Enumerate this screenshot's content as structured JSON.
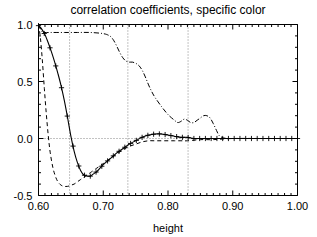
{
  "chart_data": {
    "type": "line",
    "title": "correlation coefficients, specific color",
    "xlabel": "height",
    "ylabel": "",
    "xlim": [
      0.6,
      1.0
    ],
    "ylim": [
      -0.5,
      1.0
    ],
    "grid": true,
    "grid_style": "dotted",
    "legend_position": "none",
    "xticks": [
      0.6,
      0.7,
      0.8,
      0.9,
      1.0
    ],
    "xticklabels": [
      "0.60",
      "0.70",
      "0.80",
      "0.90",
      "1.00"
    ],
    "yticks": [
      -0.5,
      0.0,
      0.5,
      1.0
    ],
    "yticklabels": [
      "-0.5",
      "0.0",
      "0.5",
      "1.0"
    ],
    "x_minor_ticks_per_major": 10,
    "y_minor_ticks_per_major": 5,
    "vertical_gridlines": [
      0.648,
      0.738,
      0.831
    ],
    "horizontal_gridlines": [
      0.0
    ],
    "series": [
      {
        "name": "solid-with-plus-markers",
        "style": "solid",
        "marker": "plus",
        "x": [
          0.6,
          0.605,
          0.61,
          0.615,
          0.62,
          0.625,
          0.63,
          0.635,
          0.64,
          0.645,
          0.65,
          0.655,
          0.66,
          0.665,
          0.67,
          0.675,
          0.68,
          0.685,
          0.69,
          0.695,
          0.7,
          0.71,
          0.72,
          0.73,
          0.74,
          0.75,
          0.76,
          0.77,
          0.78,
          0.79,
          0.8,
          0.81,
          0.82,
          0.83,
          0.84,
          0.85,
          0.86,
          0.87,
          0.88,
          0.89,
          0.9,
          0.92,
          0.94,
          0.96,
          0.98,
          1.0
        ],
        "y": [
          0.99,
          0.96,
          0.91,
          0.84,
          0.76,
          0.67,
          0.57,
          0.46,
          0.33,
          0.18,
          0.02,
          -0.11,
          -0.21,
          -0.28,
          -0.32,
          -0.33,
          -0.33,
          -0.31,
          -0.29,
          -0.26,
          -0.23,
          -0.18,
          -0.13,
          -0.09,
          -0.05,
          -0.02,
          0.01,
          0.03,
          0.04,
          0.04,
          0.03,
          0.02,
          0.01,
          0.01,
          0.0,
          0.0,
          0.0,
          0.0,
          0.0,
          0.0,
          0.0,
          0.0,
          0.0,
          0.0,
          0.0,
          0.0
        ]
      },
      {
        "name": "dashed",
        "style": "dashed",
        "marker": "none",
        "x": [
          0.6,
          0.603,
          0.606,
          0.609,
          0.612,
          0.615,
          0.618,
          0.622,
          0.626,
          0.63,
          0.635,
          0.64,
          0.645,
          0.65,
          0.655,
          0.66,
          0.665,
          0.67,
          0.675,
          0.68,
          0.69,
          0.7,
          0.71,
          0.72,
          0.73,
          0.74,
          0.75,
          0.76,
          0.77,
          0.78,
          0.79,
          0.8,
          0.81,
          0.82,
          0.83,
          0.85,
          0.87,
          0.9,
          0.95,
          1.0
        ],
        "y": [
          1.0,
          0.88,
          0.68,
          0.44,
          0.22,
          0.03,
          -0.12,
          -0.25,
          -0.33,
          -0.38,
          -0.41,
          -0.42,
          -0.42,
          -0.41,
          -0.4,
          -0.38,
          -0.36,
          -0.34,
          -0.32,
          -0.3,
          -0.26,
          -0.22,
          -0.18,
          -0.14,
          -0.1,
          -0.07,
          -0.05,
          -0.03,
          -0.02,
          -0.02,
          -0.02,
          -0.02,
          -0.02,
          -0.02,
          -0.02,
          -0.01,
          -0.01,
          0.0,
          0.0,
          0.0
        ]
      },
      {
        "name": "dash-dot",
        "style": "dashdot",
        "marker": "none",
        "x": [
          0.6,
          0.605,
          0.61,
          0.62,
          0.64,
          0.66,
          0.68,
          0.7,
          0.71,
          0.715,
          0.72,
          0.725,
          0.73,
          0.735,
          0.74,
          0.745,
          0.75,
          0.755,
          0.76,
          0.765,
          0.77,
          0.775,
          0.78,
          0.79,
          0.8,
          0.81,
          0.815,
          0.82,
          0.825,
          0.83,
          0.835,
          0.84,
          0.845,
          0.85,
          0.855,
          0.86,
          0.865,
          0.87,
          0.875,
          0.88,
          0.89,
          0.9,
          0.92,
          0.95,
          1.0
        ],
        "y": [
          1.0,
          0.94,
          0.93,
          0.93,
          0.93,
          0.93,
          0.93,
          0.92,
          0.9,
          0.87,
          0.82,
          0.76,
          0.71,
          0.68,
          0.67,
          0.67,
          0.66,
          0.64,
          0.6,
          0.54,
          0.47,
          0.41,
          0.36,
          0.28,
          0.21,
          0.16,
          0.14,
          0.15,
          0.17,
          0.16,
          0.14,
          0.14,
          0.16,
          0.18,
          0.2,
          0.2,
          0.18,
          0.13,
          0.07,
          0.02,
          0.0,
          0.0,
          0.0,
          0.0,
          0.0
        ]
      }
    ]
  },
  "colors": {
    "foreground": "#000000",
    "background": "#ffffff",
    "grid": "#555555"
  }
}
